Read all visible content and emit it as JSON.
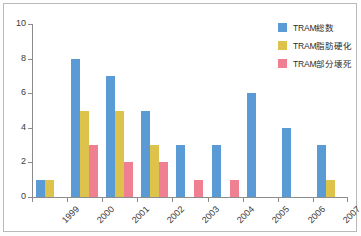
{
  "chart_data": {
    "type": "bar",
    "title": "",
    "xlabel": "",
    "ylabel": "",
    "ylim": [
      0,
      10
    ],
    "y_ticks": [
      0,
      2,
      4,
      6,
      8,
      10
    ],
    "grid": false,
    "legend_position": "top-right",
    "categories": [
      "1999",
      "2000",
      "2001",
      "2002",
      "2003",
      "2004",
      "2005",
      "2006",
      "2007"
    ],
    "series": [
      {
        "name": "TRAM総数",
        "color": "#5b9bd5",
        "values": [
          1,
          8,
          7,
          5,
          3,
          3,
          6,
          4,
          3
        ]
      },
      {
        "name": "TRAM脂肪硬化",
        "color": "#ddc24c",
        "values": [
          1,
          5,
          5,
          3,
          0,
          0,
          0,
          0,
          1
        ]
      },
      {
        "name": "TRAM部分壊死",
        "color": "#ef7f91",
        "values": [
          0,
          3,
          2,
          2,
          1,
          1,
          0,
          0,
          0
        ]
      }
    ]
  },
  "legend": {
    "items": [
      {
        "label": "TRAM総数"
      },
      {
        "label": "TRAM脂肪硬化"
      },
      {
        "label": "TRAM部分壊死"
      }
    ]
  }
}
